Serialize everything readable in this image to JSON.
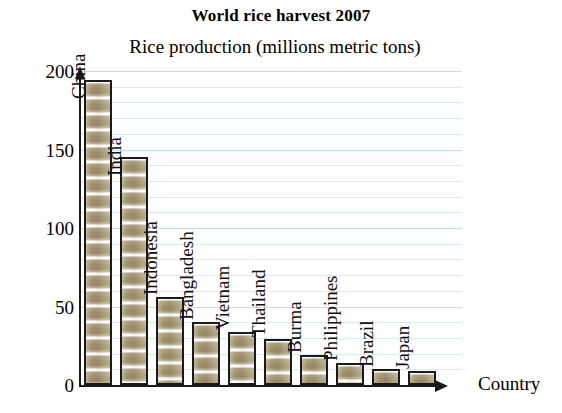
{
  "chart_data": {
    "type": "bar",
    "title": "World rice harvest 2007",
    "ylabel": "Rice production (millions metric tons)",
    "xlabel": "Country",
    "categories": [
      "China",
      "India",
      "Indonesia",
      "Bangladesh",
      "Vietnam",
      "Thailand",
      "Burma",
      "Philippines",
      "Brazil",
      "Japan"
    ],
    "values": [
      194,
      145,
      56,
      40,
      34,
      29,
      19,
      14,
      10,
      9
    ],
    "ylim": [
      0,
      200
    ],
    "yticks": [
      0,
      50,
      100,
      150,
      200
    ],
    "ytick_labels": [
      "0",
      "50",
      "100",
      "150",
      "200"
    ],
    "grid": true,
    "grid_interval": 10,
    "grid_color": "#d8ecf4",
    "legend": "none",
    "bar_fill_color": "#a2936c",
    "bar_edge_color": "#1a1a1a",
    "label_rotation": 90
  },
  "axes": {
    "y_arrow": "up-arrow-icon",
    "x_arrow": "right-arrow-icon"
  }
}
